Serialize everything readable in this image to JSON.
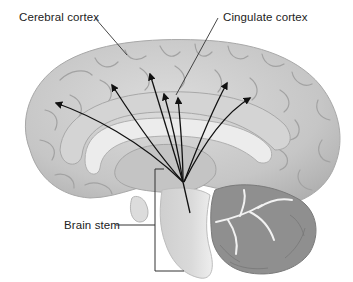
{
  "diagram": {
    "labels": {
      "cerebral_cortex": "Cerebral cortex",
      "cingulate_cortex": "Cingulate cortex",
      "brain_stem": "Brain stem"
    },
    "arrows": {
      "origin": "brain stem",
      "count": 7,
      "targets": "cerebral cortex and cingulate cortex"
    },
    "colors": {
      "background": "#ffffff",
      "brain_fill": "#c9c9c9",
      "brain_light": "#dedede",
      "brain_shadow": "#9a9a9a",
      "cerebellum": "#8f8f8f",
      "arrow": "#111111",
      "leader_line": "#333333",
      "label_text": "#222222"
    }
  }
}
